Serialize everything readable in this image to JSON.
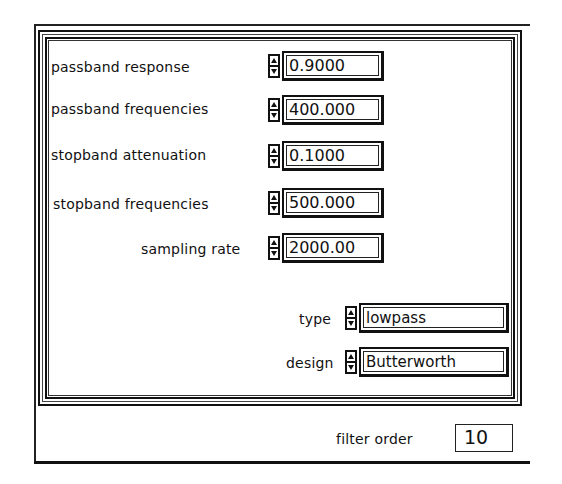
{
  "panel": {
    "controls": [
      {
        "label": "passband response",
        "value": "0.9000"
      },
      {
        "label": "passband frequencies",
        "value": "400.000"
      },
      {
        "label": "stopband attenuation",
        "value": "0.1000"
      },
      {
        "label": "stopband frequencies",
        "value": "500.000"
      },
      {
        "label": "sampling rate",
        "value": "2000.00"
      }
    ],
    "rings": [
      {
        "label": "type",
        "value": "lowpass"
      },
      {
        "label": "design",
        "value": "Butterworth"
      }
    ]
  },
  "indicator": {
    "label": "filter order",
    "value": "10"
  },
  "icons": {
    "spinner": "increment-decrement-arrows-icon"
  },
  "colors": {
    "foreground": "#111111",
    "background": "#ffffff"
  }
}
